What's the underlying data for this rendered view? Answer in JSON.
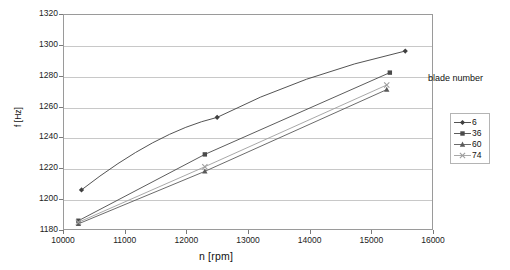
{
  "chart_data": {
    "type": "line",
    "title": "",
    "xlabel": "n [rpm]",
    "ylabel": "f [Hz]",
    "xlim": [
      10000,
      16000
    ],
    "ylim": [
      1180,
      1320
    ],
    "xticks": [
      10000,
      11000,
      12000,
      13000,
      14000,
      15000,
      16000
    ],
    "yticks": [
      1180,
      1200,
      1220,
      1240,
      1260,
      1280,
      1300,
      1320
    ],
    "grid": "horizontal",
    "legend_title": "blade number",
    "legend_position": "right-outside",
    "series": [
      {
        "name": "6",
        "marker": "diamond",
        "color": "#404040",
        "x": [
          10300,
          12500,
          15550
        ],
        "y": [
          1206,
          1253,
          1296
        ]
      },
      {
        "name": "36",
        "marker": "square",
        "color": "#4a4a4a",
        "x": [
          10250,
          12300,
          15300
        ],
        "y": [
          1186,
          1229,
          1282
        ]
      },
      {
        "name": "60",
        "marker": "triangle",
        "color": "#5a5a5a",
        "x": [
          10250,
          12300,
          15250
        ],
        "y": [
          1184,
          1218,
          1271
        ]
      },
      {
        "name": "74",
        "marker": "cross",
        "color": "#9e9e9e",
        "x": [
          10250,
          12300,
          15250
        ],
        "y": [
          1185,
          1221,
          1274
        ]
      }
    ]
  },
  "axes": {
    "y_tick_labels": [
      "1320",
      "1300",
      "1280",
      "1260",
      "1240",
      "1220",
      "1200",
      "1180"
    ],
    "x_tick_labels": [
      "10000",
      "11000",
      "12000",
      "13000",
      "14000",
      "15000",
      "16000"
    ]
  },
  "legend": {
    "title": "blade number",
    "entries": [
      {
        "label": "6"
      },
      {
        "label": "36"
      },
      {
        "label": "60"
      },
      {
        "label": "74"
      }
    ]
  }
}
